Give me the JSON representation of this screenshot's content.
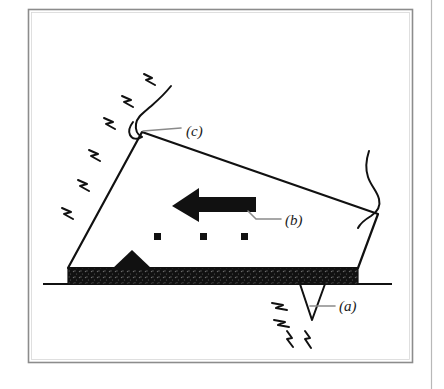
{
  "figure": {
    "title": "",
    "frame": {
      "border_color": "#8c8c8c",
      "page_edge_color": "#b8b8b8",
      "background": "#ffffff"
    },
    "ink_color": "#111111",
    "leader_color": "#7a7a7a",
    "labels": [
      {
        "id": "label-a",
        "text": "(a)",
        "x": 339,
        "y": 310,
        "points_to": "stylus-tip-spike"
      },
      {
        "id": "label-b",
        "text": "(b)",
        "x": 285,
        "y": 221,
        "points_to": "motion-arrow"
      },
      {
        "id": "label-c",
        "text": "(c)",
        "x": 186,
        "y": 131,
        "points_to": "cartridge-apex"
      }
    ],
    "elements": {
      "body_polygon_name": "cartridge-body",
      "arrow_name": "motion-arrow",
      "arrow_direction": "left",
      "ground_line_name": "ground-line",
      "base_bar_name": "hatched-base-bar",
      "base_bump_name": "base-triangle-bump",
      "spike_name": "stylus-tip-spike",
      "dots_count": 3,
      "left_sparks_count": 6,
      "bottom_sparks_count": 4
    }
  }
}
